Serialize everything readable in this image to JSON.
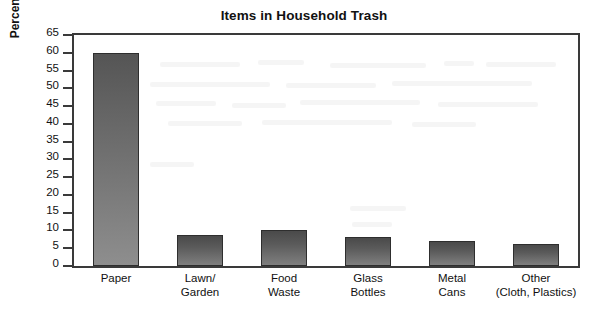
{
  "chart_data": {
    "type": "bar",
    "title": "Items in Household Trash",
    "xlabel": "",
    "ylabel": "Percent by Mass",
    "ylim": [
      0,
      65
    ],
    "ytick_step": 5,
    "yticks": [
      65,
      60,
      55,
      50,
      45,
      40,
      35,
      30,
      25,
      20,
      15,
      10,
      5,
      0
    ],
    "ytick_labels": [
      "65",
      "60",
      "55",
      "50",
      "45",
      "40",
      "35",
      "30",
      "25",
      "20",
      "15",
      "10",
      "5",
      "0"
    ],
    "grid": false,
    "legend": false,
    "categories": [
      "Paper",
      "Lawn/ Garden",
      "Food Waste",
      "Glass Bottles",
      "Metal Cans",
      "Other (Cloth, Plastics)"
    ],
    "category_lines": [
      {
        "line1": "Paper",
        "line2": ""
      },
      {
        "line1": "Lawn/",
        "line2": "Garden"
      },
      {
        "line1": "Food",
        "line2": "Waste"
      },
      {
        "line1": "Glass",
        "line2": "Bottles"
      },
      {
        "line1": "Metal",
        "line2": "Cans"
      },
      {
        "line1": "Other",
        "line2": "(Cloth, Plastics)"
      }
    ],
    "values": [
      60,
      8.7,
      10,
      8.1,
      7.1,
      6.1
    ],
    "bar_fill_top": "#4a4a4a",
    "bar_fill_bottom": "#8e8e8e",
    "bar_outline": "#2e2e2e",
    "axis_color": "#3a3a3a",
    "background": "#ffffff"
  }
}
